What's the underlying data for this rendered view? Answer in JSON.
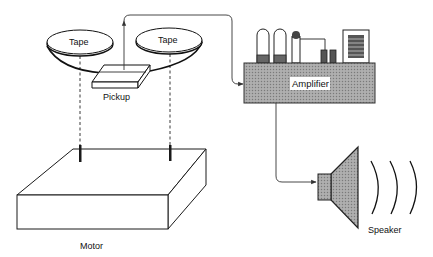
{
  "diagram": {
    "labels": {
      "tape_left": "Tape",
      "tape_right": "Tape",
      "pickup": "Pickup",
      "amplifier": "Amplifier",
      "motor": "Motor",
      "speaker": "Speaker"
    },
    "components": [
      {
        "id": "tape-left",
        "label": "Tape"
      },
      {
        "id": "tape-right",
        "label": "Tape"
      },
      {
        "id": "pickup",
        "label": "Pickup"
      },
      {
        "id": "amplifier",
        "label": "Amplifier"
      },
      {
        "id": "motor",
        "label": "Motor"
      },
      {
        "id": "speaker",
        "label": "Speaker"
      }
    ],
    "connections": [
      {
        "from": "pickup",
        "to": "amplifier",
        "type": "signal-arrow"
      },
      {
        "from": "amplifier",
        "to": "speaker",
        "type": "signal-arrow"
      },
      {
        "from": "motor",
        "to": "tape-left",
        "type": "dashed-shaft"
      },
      {
        "from": "motor",
        "to": "tape-right",
        "type": "dashed-shaft"
      }
    ],
    "colors": {
      "stroke": "#1a1a1a",
      "fill_gray": "#9a9a9a",
      "background": "#ffffff"
    }
  }
}
